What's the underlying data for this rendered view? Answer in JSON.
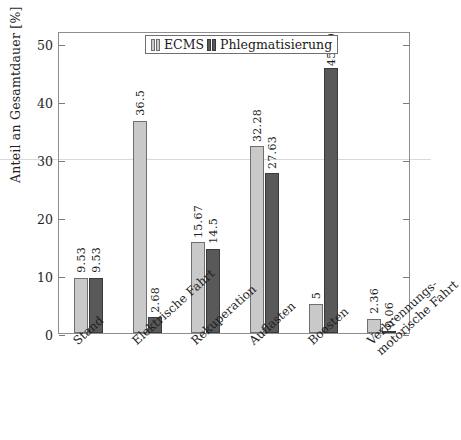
{
  "chart_data": {
    "type": "bar",
    "title": "",
    "xlabel": "",
    "ylabel": "Anteil an Gesamtdauer [%]",
    "ylim": [
      0,
      52
    ],
    "yticks": [
      0,
      10,
      20,
      30,
      40,
      50
    ],
    "grid": false,
    "legend_position": "top-center",
    "categories": [
      "Stand",
      "Elektrische Fahrt",
      "Rekuperation",
      "Auflasten",
      "Boosten",
      "Verbrennungsmotorische Fahrt"
    ],
    "category_lines": [
      [
        "Stand"
      ],
      [
        "Elektrische Fahrt"
      ],
      [
        "Rekuperation"
      ],
      [
        "Auflasten"
      ],
      [
        "Boosten"
      ],
      [
        "Verbrennungs-",
        "motorische Fahrt"
      ]
    ],
    "series": [
      {
        "name": "ECMS",
        "color": "#c9c9c9",
        "values": [
          9.53,
          36.5,
          15.67,
          32.28,
          5,
          2.36
        ],
        "labels": [
          "9.53",
          "36.5",
          "15.67",
          "32.28",
          "5",
          "2.36"
        ]
      },
      {
        "name": "Phlegmatisierung",
        "color": "#595959",
        "values": [
          9.53,
          2.68,
          14.5,
          27.63,
          45.59,
          0.06
        ],
        "labels": [
          "9.53",
          "2.68",
          "14.5",
          "27.63",
          "45.59",
          "0.06"
        ]
      }
    ]
  },
  "axis": {
    "y_title": "Anteil an Gesamtdauer [%]",
    "ticks": [
      "50",
      "40",
      "30",
      "20",
      "10",
      "0"
    ]
  },
  "legend": {
    "entries": [
      {
        "label": "ECMS"
      },
      {
        "label": "Phlegmatisierung"
      }
    ]
  }
}
